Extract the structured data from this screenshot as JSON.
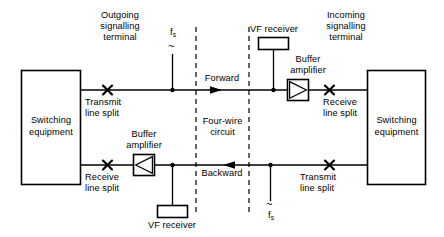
{
  "diagram": {
    "stroke_color": "#000000",
    "background_color": "#ffffff",
    "blocks": {
      "left_switching": {
        "line1": "Switching",
        "line2": "equipment"
      },
      "right_switching": {
        "line1": "Switching",
        "line2": "equipment"
      }
    },
    "labels": {
      "outgoing_terminal": "Outgoing\nsignalling\nterminal",
      "incoming_terminal": "Incoming\nsignalling\nterminal",
      "vf_receiver_top": "VF receiver",
      "vf_receiver_bottom": "VF receiver",
      "buffer_amplifier_top": "Buffer\namplifier",
      "buffer_amplifier_bottom": "Buffer\namplifier",
      "transmit_line_split_left": "Transmit\nline split",
      "receive_line_split_left": "Receive\nline split",
      "receive_line_split_right": "Receive\nline split",
      "transmit_line_split_right": "Transmit\nline split",
      "forward": "Forward",
      "backward": "Backward",
      "four_wire_circuit": "Four-wire\ncircuit",
      "fs_top": "f",
      "fs_top_sub": "s",
      "fs_bottom": "f",
      "fs_bottom_sub": "s",
      "oscillator_symbol": "~"
    },
    "icons": {
      "line_split": "x-cross-icon",
      "amplifier_forward": "triangle-right-icon",
      "amplifier_backward": "triangle-left-icon",
      "arrow_forward": "arrow-right-icon",
      "arrow_backward": "arrow-left-icon",
      "junction": "dot-icon",
      "oscillator": "tilde-icon"
    }
  }
}
